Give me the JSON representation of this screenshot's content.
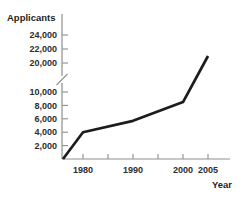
{
  "chart_data": {
    "type": "line",
    "title": "",
    "ylabel": "Applicants",
    "xlabel": "Year",
    "y_axis": {
      "ticks": [
        {
          "value": 2000,
          "label": "2,000"
        },
        {
          "value": 4000,
          "label": "4,000"
        },
        {
          "value": 6000,
          "label": "6,000"
        },
        {
          "value": 8000,
          "label": "8,000"
        },
        {
          "value": 10000,
          "label": "10,000"
        },
        {
          "value": 20000,
          "label": "20,000"
        },
        {
          "value": 22000,
          "label": "22,000"
        },
        {
          "value": 24000,
          "label": "24,000"
        }
      ],
      "break_between": [
        10000,
        20000
      ]
    },
    "x_axis": {
      "ticks": [
        {
          "value": 1980,
          "label": "1980"
        },
        {
          "value": 1985,
          "label": ""
        },
        {
          "value": 1990,
          "label": ""
        },
        {
          "value": 1990,
          "label": "1990"
        },
        {
          "value": 1995,
          "label": ""
        },
        {
          "value": 2000,
          "label": "2000"
        },
        {
          "value": 2005,
          "label": "2005"
        }
      ]
    },
    "series": [
      {
        "name": "Applicants",
        "points": [
          [
            1976,
            0
          ],
          [
            1980,
            4000
          ],
          [
            1990,
            5700
          ],
          [
            2000,
            8500
          ],
          [
            2005,
            21000
          ]
        ]
      }
    ],
    "colors": {
      "line": "#1c1c1c",
      "axis": "#8f8f8f",
      "tick_text": "#2e2e2e",
      "title_text": "#1f1f1f"
    }
  }
}
